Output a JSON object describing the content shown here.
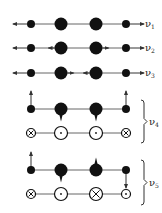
{
  "diagram": {
    "colors": {
      "ink": "#111111",
      "line": "#666666",
      "background": "#ffffff"
    },
    "atom_x": [
      31,
      61,
      96,
      126
    ],
    "atom_r": [
      4,
      6.5,
      6.5,
      4
    ],
    "modes": [
      {
        "id": "v1",
        "label_main": "ν",
        "label_sub": "1",
        "y": 24,
        "type": "stretch",
        "arrows": [
          "left",
          "none",
          "none",
          "right"
        ]
      },
      {
        "id": "v2",
        "label_main": "ν",
        "label_sub": "2",
        "y": 48,
        "type": "stretch",
        "arrows": [
          "left",
          "left",
          "right",
          "right"
        ]
      },
      {
        "id": "v3",
        "label_main": "ν",
        "label_sub": "3",
        "y": 73,
        "type": "stretch",
        "arrows": [
          "left",
          "right",
          "left",
          "right"
        ]
      },
      {
        "id": "v4",
        "label_main": "ν",
        "label_sub": "4",
        "y_top": 109,
        "y_bottom": 133,
        "type": "bend",
        "brace": [
          100,
          143
        ],
        "arrows": [
          "up",
          "down",
          "down",
          "up"
        ],
        "perpendicular": [
          "cross",
          "dot",
          "dot",
          "cross"
        ]
      },
      {
        "id": "v5",
        "label_main": "ν",
        "label_sub": "5",
        "y_top": 170,
        "y_bottom": 194,
        "type": "bend",
        "brace": [
          160,
          205
        ],
        "arrows": [
          "up",
          "down",
          "up",
          "down"
        ],
        "perpendicular": [
          "cross",
          "dot",
          "cross",
          "dot"
        ]
      }
    ]
  }
}
